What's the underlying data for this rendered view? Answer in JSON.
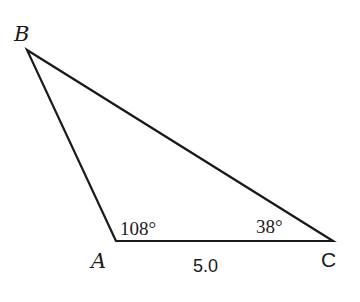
{
  "diagram": {
    "type": "triangle",
    "vertices": {
      "A": {
        "label": "A",
        "x": 116,
        "y": 241
      },
      "B": {
        "label": "B",
        "x": 27,
        "y": 50
      },
      "C": {
        "label": "C",
        "x": 333,
        "y": 241
      }
    },
    "angles": {
      "A": "108°",
      "C": "38°"
    },
    "sides": {
      "AC": "5.0"
    },
    "stroke_color": "#1a1a1a"
  }
}
